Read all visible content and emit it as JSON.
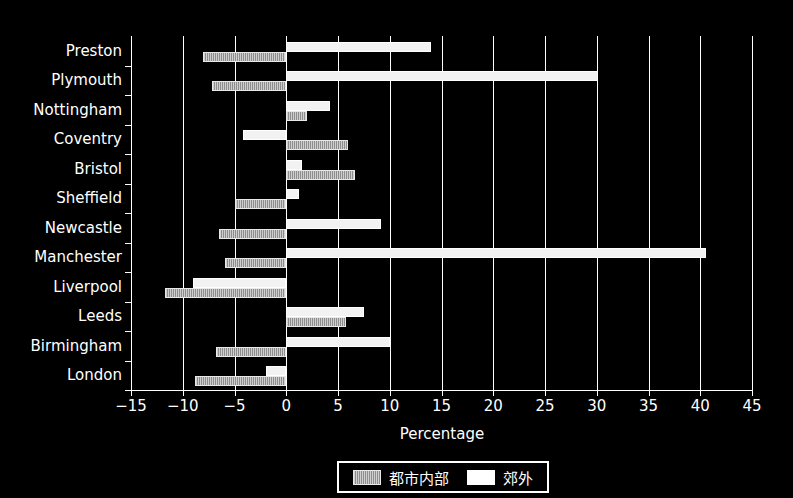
{
  "chart_data": {
    "type": "bar",
    "orientation": "horizontal",
    "title": "",
    "xlabel": "Percentage",
    "ylabel": "",
    "xlim": [
      -15,
      45
    ],
    "xticks": [
      -15,
      -10,
      -5,
      0,
      5,
      10,
      15,
      20,
      25,
      30,
      35,
      40,
      45
    ],
    "xticklabels": [
      "−15",
      "−10",
      "−5",
      "0",
      "5",
      "10",
      "15",
      "20",
      "25",
      "30",
      "35",
      "40",
      "45"
    ],
    "categories": [
      "Preston",
      "Plymouth",
      "Nottingham",
      "Coventry",
      "Bristol",
      "Sheffield",
      "Newcastle",
      "Manchester",
      "Liverpool",
      "Leeds",
      "Birmingham",
      "London"
    ],
    "grid": true,
    "grid_axis": "x",
    "legend_position": "lower center",
    "series": [
      {
        "name": "都市内部",
        "style": "hatched-gray",
        "color": "#b0b0b0",
        "values": [
          -8.0,
          -7.2,
          2.0,
          6.0,
          6.6,
          -5.0,
          -6.5,
          -5.9,
          -11.7,
          5.8,
          -6.8,
          -8.8
        ]
      },
      {
        "name": "郊外",
        "style": "solid-white",
        "color": "#ffffff",
        "values": [
          14.0,
          30.1,
          4.2,
          -4.2,
          1.5,
          1.2,
          9.2,
          40.6,
          -9.0,
          7.5,
          10.0,
          -2.0
        ]
      }
    ]
  },
  "legend": {
    "entries": [
      {
        "label": "都市内部",
        "swatch": "inner"
      },
      {
        "label": "郊外",
        "swatch": "suburb"
      }
    ]
  },
  "figure": {
    "background": "#000000",
    "foreground": "#ffffff"
  }
}
